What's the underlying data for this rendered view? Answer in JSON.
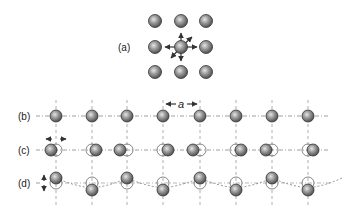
{
  "figure": {
    "panels": [
      {
        "id": "a",
        "label": "(a)",
        "description": "3x3 lattice with central atom displaced in multiple directions"
      },
      {
        "id": "b",
        "label": "(b)",
        "description": "equilibrium chain of atoms with lattice spacing a"
      },
      {
        "id": "c",
        "label": "(c)",
        "description": "longitudinal displacement of atoms along chain"
      },
      {
        "id": "d",
        "label": "(d)",
        "description": "transverse displacement of atoms perpendicular to chain"
      }
    ],
    "spacing_label": "a",
    "colors": {
      "atom_fill_dark": "#5a5a5a",
      "atom_fill_light": "#c8c8c8",
      "line": "#888888",
      "outline": "#333333"
    },
    "chain": {
      "columns_x": [
        56,
        92,
        127,
        163,
        200,
        236,
        272,
        308
      ],
      "row_b_y": 116,
      "row_c_y": 150,
      "row_d_y": 183,
      "c_offsets": [
        -4,
        4,
        -4,
        4,
        -4,
        4,
        -4,
        4
      ],
      "d_offsets": [
        -5,
        5,
        -5,
        5,
        -5,
        5,
        -5,
        5
      ]
    }
  }
}
